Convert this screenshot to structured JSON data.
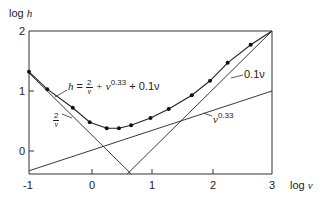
{
  "chart_data": {
    "type": "line",
    "title": "",
    "xlabel": "log ν",
    "ylabel": "log h",
    "xlim": [
      -1,
      3
    ],
    "ylim": [
      -0.38,
      2
    ],
    "x_ticks": [
      "-1",
      "0",
      "1",
      "2",
      "3"
    ],
    "y_ticks": [
      "0",
      "1",
      "2"
    ],
    "grid": false,
    "legend": "none (inline annotations)",
    "series": [
      {
        "name": "h = 2/ν + ν^0.33 + 0.1ν",
        "kind": "curve with data points",
        "x": [
          -1.0,
          -0.7,
          -0.28,
          0.0,
          0.28,
          0.48,
          0.68,
          1.0,
          1.3,
          1.68,
          1.98,
          2.27,
          2.65
        ],
        "y": [
          1.32,
          1.03,
          0.72,
          0.48,
          0.38,
          0.38,
          0.43,
          0.55,
          0.7,
          0.93,
          1.17,
          1.47,
          1.77
        ]
      },
      {
        "name": "2/ν",
        "kind": "straight line",
        "x": [
          -1,
          0.68
        ],
        "y": [
          1.3,
          -0.38
        ]
      },
      {
        "name": "0.1ν",
        "kind": "straight line",
        "x": [
          0.62,
          3
        ],
        "y": [
          -0.38,
          2.0
        ]
      },
      {
        "name": "ν^0.33",
        "kind": "straight line",
        "x": [
          -1,
          3
        ],
        "y": [
          -0.33,
          1.0
        ]
      }
    ],
    "annotations": [
      {
        "text": "h = 2/ν + ν^0.33 + 0.1ν",
        "target": "combined curve"
      },
      {
        "text": "2/ν",
        "target": "2/ν line"
      },
      {
        "text": "0.1ν",
        "target": "0.1ν line"
      },
      {
        "text": "ν^0.33",
        "target": "ν^0.33 line"
      }
    ]
  },
  "labels": {
    "ylabel": "log",
    "ylabel_var": "h",
    "xlabel": "log",
    "xlabel_var": "ν",
    "formula_lhs": "h",
    "formula_eq": "=",
    "frac_num": "2",
    "frac_den": "ν",
    "formula_mid": "+ ν",
    "formula_exp": "0.33",
    "formula_tail": "+ 0.1ν",
    "line_2v_num": "2",
    "line_2v_den": "ν",
    "line_01v": "0.1ν",
    "line_v033_base": "ν",
    "line_v033_exp": "0.33"
  },
  "ticks": {
    "x": [
      "-1",
      "0",
      "1",
      "2",
      "3"
    ],
    "y": [
      "0",
      "1",
      "2"
    ]
  }
}
